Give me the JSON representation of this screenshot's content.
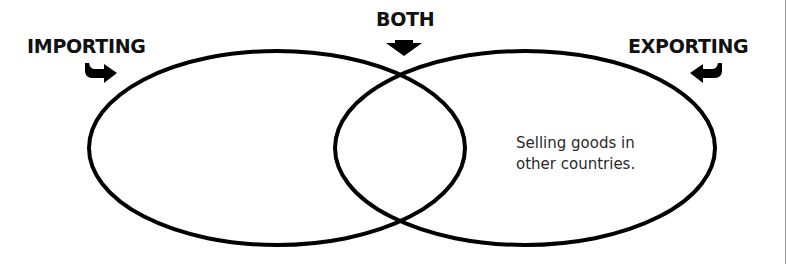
{
  "diagram": {
    "type": "venn",
    "labels": {
      "left": "IMPORTING",
      "center": "BOTH",
      "right": "EXPORTING"
    },
    "regions": {
      "left_only": "",
      "overlap": "",
      "right_only": {
        "line1": "Selling goods in",
        "line2": "other countries."
      }
    },
    "icons": {
      "left_arrow": "curved-arrow-right-icon",
      "center_arrow": "arrow-down-icon",
      "right_arrow": "curved-arrow-left-icon"
    },
    "colors": {
      "stroke": "#000000",
      "label": "#111111",
      "note": "#2a2a2a",
      "background": "#ffffff"
    }
  }
}
